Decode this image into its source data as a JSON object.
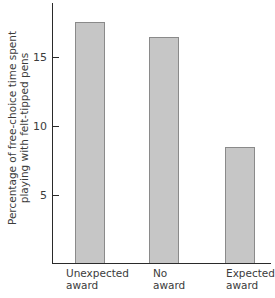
{
  "chart_data": {
    "type": "bar",
    "title": "",
    "xlabel": "",
    "ylabel": "Percentage of free-choice time spent playing with felt-tipped pens",
    "ylabel_lines": [
      "Percentage of free-choice time spent",
      "playing with felt-tipped pens"
    ],
    "categories": [
      "Unexpected award",
      "No award",
      "Expected award"
    ],
    "category_lines": [
      [
        "Unexpected",
        "award"
      ],
      [
        "No",
        "award"
      ],
      [
        "Expected",
        "award"
      ]
    ],
    "values": [
      17.5,
      16.4,
      8.4
    ],
    "yticks": [
      5,
      10,
      15
    ],
    "ylim": [
      0,
      19
    ],
    "grid": false,
    "legend": null,
    "bar_color": "#c6c6c6",
    "bar_edge_color": "#8a8a8a"
  }
}
